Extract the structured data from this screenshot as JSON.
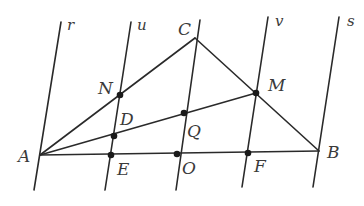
{
  "diagram": {
    "parallel_lines": [
      {
        "name": "r",
        "x1": 61,
        "y1": 22,
        "x2": 34,
        "y2": 190,
        "label_x": 67,
        "label_y": 30
      },
      {
        "name": "u",
        "x1": 131,
        "y1": 22,
        "x2": 105,
        "y2": 190,
        "label_x": 137,
        "label_y": 30
      },
      {
        "name": "",
        "x1": 200,
        "y1": 20,
        "x2": 176,
        "y2": 190,
        "label_x": 0,
        "label_y": 0
      },
      {
        "name": "v",
        "x1": 268,
        "y1": 17,
        "x2": 242,
        "y2": 187,
        "label_x": 275,
        "label_y": 26
      },
      {
        "name": "s",
        "x1": 339,
        "y1": 17,
        "x2": 313,
        "y2": 187,
        "label_x": 347,
        "label_y": 26
      }
    ],
    "segments": [
      {
        "name": "AB",
        "from": "A",
        "to": "B"
      },
      {
        "name": "AC",
        "from": "A",
        "to": "C"
      },
      {
        "name": "BC",
        "from": "B",
        "to": "C"
      },
      {
        "name": "AM",
        "from": "A",
        "to": "M"
      }
    ],
    "points": {
      "A": {
        "x": 40,
        "y": 155,
        "dot": false,
        "label": "A",
        "lx": 18,
        "ly": 162
      },
      "B": {
        "x": 319,
        "y": 151,
        "dot": false,
        "label": "B",
        "lx": 327,
        "ly": 158
      },
      "C": {
        "x": 195,
        "y": 38,
        "dot": false,
        "label": "C",
        "lx": 178,
        "ly": 35
      },
      "N": {
        "x": 120,
        "y": 95,
        "dot": true,
        "label": "N",
        "lx": 98,
        "ly": 94
      },
      "M": {
        "x": 256,
        "y": 93,
        "dot": true,
        "label": "M",
        "lx": 268,
        "ly": 91
      },
      "D": {
        "x": 114,
        "y": 136,
        "dot": true,
        "label": "D",
        "lx": 120,
        "ly": 125
      },
      "Q": {
        "x": 184,
        "y": 113,
        "dot": true,
        "label": "Q",
        "lx": 187,
        "ly": 137
      },
      "E": {
        "x": 111,
        "y": 155,
        "dot": true,
        "label": "E",
        "lx": 117,
        "ly": 175
      },
      "O": {
        "x": 177,
        "y": 154,
        "dot": true,
        "label": "O",
        "lx": 182,
        "ly": 174
      },
      "F": {
        "x": 248,
        "y": 153,
        "dot": true,
        "label": "F",
        "lx": 254,
        "ly": 172
      }
    },
    "colors": {
      "line": "#2a2a2a",
      "label": "#3a3a3a",
      "background": "#ffffff"
    }
  }
}
